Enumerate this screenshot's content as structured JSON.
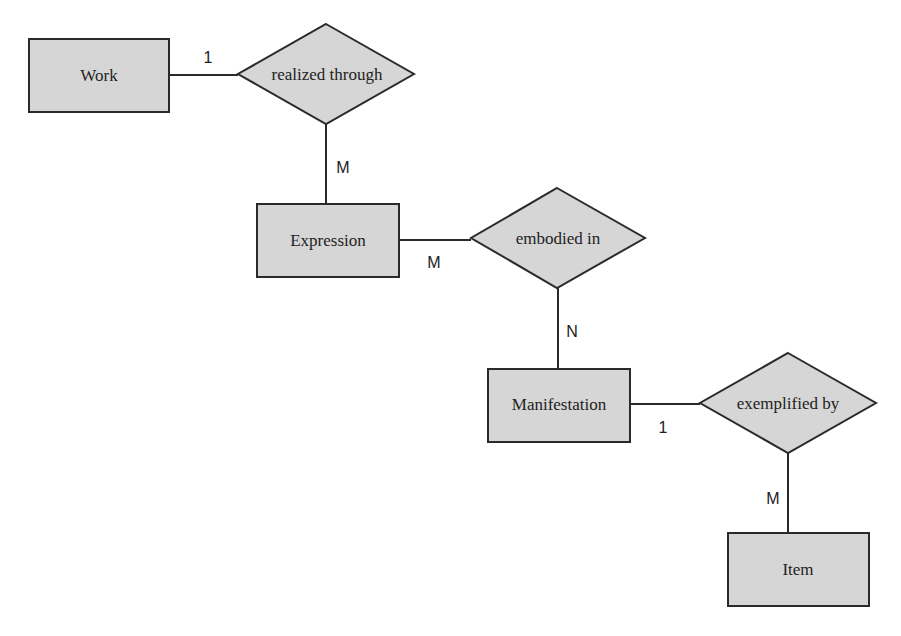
{
  "diagram": {
    "type": "entity-relationship",
    "colors": {
      "background": "#ffffff",
      "shape_fill": "#d6d6d6",
      "stroke": "#2a2a2a",
      "text": "#222222"
    },
    "entities": [
      {
        "id": "work",
        "label": "Work"
      },
      {
        "id": "expression",
        "label": "Expression"
      },
      {
        "id": "manifestation",
        "label": "Manifestation"
      },
      {
        "id": "item",
        "label": "Item"
      }
    ],
    "relationships": [
      {
        "id": "realized",
        "label": "realized through",
        "from": "work",
        "to": "expression",
        "from_cardinality": "1",
        "to_cardinality": "M"
      },
      {
        "id": "embodied",
        "label": "embodied in",
        "from": "expression",
        "to": "manifestation",
        "from_cardinality": "M",
        "to_cardinality": "N"
      },
      {
        "id": "exemplified",
        "label": "exemplified by",
        "from": "manifestation",
        "to": "item",
        "from_cardinality": "1",
        "to_cardinality": "M"
      }
    ]
  }
}
